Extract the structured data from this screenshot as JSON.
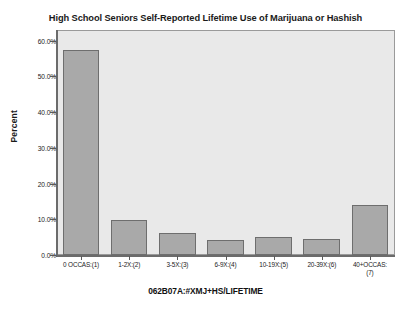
{
  "chart_data": {
    "type": "bar",
    "title": "High School Seniors Self-Reported Lifetime Use of Marijuana or Hashish",
    "xlabel": "062B07A:#XMJ+HS/LIFETIME",
    "ylabel": "Percent",
    "categories": [
      "0 OCCAS:(1)",
      "1-2X:(2)",
      "3-5X:(3)",
      "6-9X:(4)",
      "10-19X:(5)",
      "20-39X:(6)",
      "40+OCCAS:\n(7)"
    ],
    "values": [
      57.5,
      9.9,
      6.1,
      4.3,
      5.1,
      4.5,
      14.0
    ],
    "ylim": [
      0,
      63
    ],
    "yticks": [
      0,
      10,
      20,
      30,
      40,
      50,
      60
    ],
    "ytick_labels": [
      "0.0%",
      "10.0%",
      "20.0%",
      "30.0%",
      "40.0%",
      "50.0%",
      "60.0%"
    ],
    "grid": false,
    "legend": false,
    "bar_color": "#a9a9a9",
    "bar_border_color": "#6e6e6e",
    "plot_background": "#e9e9e9",
    "figure_background": "#ffffff",
    "axis_color": "#6b6b6b"
  }
}
